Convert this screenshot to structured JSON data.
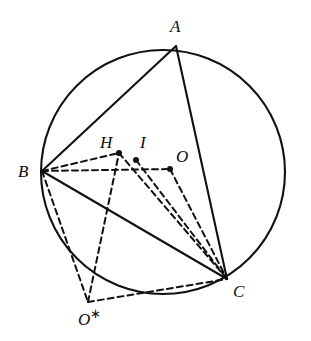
{
  "figure": {
    "type": "geometry-diagram",
    "background_color": "#ffffff",
    "stroke_color": "#111111",
    "canvas": {
      "width": 311,
      "height": 341
    }
  },
  "circle": {
    "name": "circumcircle",
    "cx": 163,
    "cy": 172,
    "r": 122,
    "stroke_width": 2.1,
    "style": "solid"
  },
  "points": [
    {
      "id": "A",
      "label": "A",
      "x": 176,
      "y": 46,
      "label_x": 170,
      "label_y": 18,
      "dot": false,
      "starred": false
    },
    {
      "id": "B",
      "label": "B",
      "x": 42,
      "y": 171,
      "label_x": 18,
      "label_y": 163,
      "dot": false,
      "starred": false
    },
    {
      "id": "C",
      "label": "C",
      "x": 227,
      "y": 279,
      "label_x": 233,
      "label_y": 283,
      "dot": false,
      "starred": false
    },
    {
      "id": "H",
      "label": "H",
      "x": 119,
      "y": 153,
      "label_x": 100,
      "label_y": 134,
      "dot": true,
      "starred": false
    },
    {
      "id": "I",
      "label": "I",
      "x": 136,
      "y": 160,
      "label_x": 140,
      "label_y": 134,
      "dot": true,
      "starred": false
    },
    {
      "id": "O",
      "label": "O",
      "x": 170,
      "y": 169,
      "label_x": 176,
      "label_y": 148,
      "dot": true,
      "starred": false
    },
    {
      "id": "Ostar",
      "label": "O",
      "x": 88,
      "y": 302,
      "label_x": 78,
      "label_y": 307,
      "dot": false,
      "starred": true
    }
  ],
  "solid_segments": [
    {
      "name": "segment-AB",
      "from": "A",
      "to": "B"
    },
    {
      "name": "segment-AC",
      "from": "A",
      "to": "C"
    },
    {
      "name": "segment-BC",
      "from": "B",
      "to": "C"
    }
  ],
  "dashed_segments": [
    {
      "name": "segment-BO",
      "from": "B",
      "to": "O"
    },
    {
      "name": "segment-BH",
      "from": "B",
      "to": "H"
    },
    {
      "name": "segment-HC",
      "from": "H",
      "to": "C"
    },
    {
      "name": "segment-IC",
      "from": "I",
      "to": "C"
    },
    {
      "name": "segment-OC",
      "from": "O",
      "to": "C"
    },
    {
      "name": "segment-BOstar",
      "from": "B",
      "to": "Ostar"
    },
    {
      "name": "segment-OstarH",
      "from": "Ostar",
      "to": "H"
    },
    {
      "name": "segment-OstarC",
      "from": "Ostar",
      "to": "C"
    }
  ],
  "dash_pattern": "6,4",
  "dash_width": 2.0,
  "solid_width": 2.1,
  "dot_radius": 3.0
}
